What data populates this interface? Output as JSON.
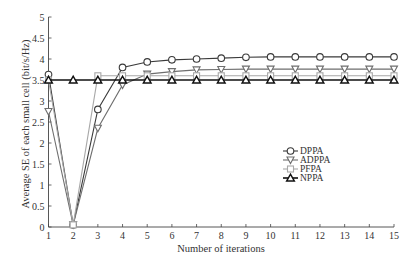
{
  "chart_data": {
    "type": "line",
    "title": "",
    "xlabel": "Number of iterations",
    "ylabel": "Average SE of each small cell (bit/s/Hz)",
    "x": [
      1,
      2,
      3,
      4,
      5,
      6,
      7,
      8,
      9,
      10,
      11,
      12,
      13,
      14,
      15
    ],
    "xlim": [
      1,
      15
    ],
    "ylim": [
      0,
      5
    ],
    "xticks": [
      "1",
      "2",
      "3",
      "4",
      "5",
      "6",
      "7",
      "8",
      "9",
      "10",
      "11",
      "12",
      "13",
      "14",
      "15"
    ],
    "yticks": [
      "0",
      "0.5",
      "1",
      "1.5",
      "2",
      "2.5",
      "3",
      "3.5",
      "4",
      "4.5",
      "5"
    ],
    "grid": false,
    "legend_position": "center-right",
    "series": [
      {
        "name": "DPPA",
        "marker": "circle",
        "color": "#3a3a3a",
        "values": [
          3.63,
          0.05,
          2.8,
          3.8,
          3.93,
          3.98,
          4.0,
          4.02,
          4.04,
          4.05,
          4.05,
          4.05,
          4.05,
          4.05,
          4.05
        ]
      },
      {
        "name": "ADPPA",
        "marker": "triangle-down",
        "color": "#6e6e6e",
        "values": [
          2.75,
          0.05,
          2.35,
          3.38,
          3.64,
          3.7,
          3.74,
          3.75,
          3.76,
          3.76,
          3.76,
          3.76,
          3.76,
          3.76,
          3.76
        ]
      },
      {
        "name": "PFPA",
        "marker": "square",
        "color": "#a8a8a8",
        "values": [
          3.5,
          0.05,
          3.6,
          3.6,
          3.6,
          3.6,
          3.6,
          3.6,
          3.6,
          3.6,
          3.6,
          3.6,
          3.6,
          3.6,
          3.6
        ]
      },
      {
        "name": "NPPA",
        "marker": "triangle-up",
        "color": "#111111",
        "values": [
          3.5,
          3.5,
          3.5,
          3.5,
          3.5,
          3.5,
          3.5,
          3.5,
          3.5,
          3.5,
          3.5,
          3.5,
          3.5,
          3.5,
          3.5
        ]
      }
    ]
  }
}
